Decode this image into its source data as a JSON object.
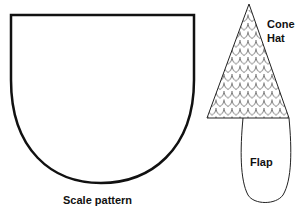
{
  "diagram": {
    "labels": {
      "scale_pattern": "Scale pattern",
      "cone_hat_line1": "Cone",
      "cone_hat_line2": "Hat",
      "flap": "Flap"
    },
    "colors": {
      "stroke": "#111111",
      "background": "#ffffff"
    },
    "shapes": [
      {
        "name": "scale-pattern-shape",
        "kind": "shield"
      },
      {
        "name": "cone-hat-shape",
        "kind": "triangle-with-scales"
      },
      {
        "name": "flap-shape",
        "kind": "rounded-flap"
      }
    ]
  }
}
